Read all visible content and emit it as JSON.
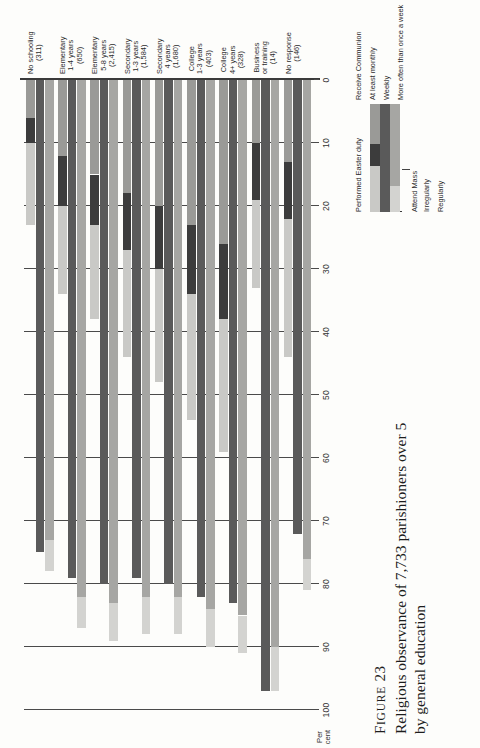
{
  "caption": {
    "figure_word": "F",
    "figure_word_rest": "IGURE",
    "figure_number": "23",
    "line1": "Religious observance of 7,733 parishioners over 5",
    "line2": "by general education"
  },
  "axis": {
    "title_line1": "Per",
    "title_line2": "cent",
    "ticks": [
      "100",
      "90",
      "80",
      "70",
      "60",
      "50",
      "40",
      "30",
      "20",
      "10",
      "0"
    ],
    "min": 0,
    "max": 100
  },
  "legend": {
    "group_a_label": "Attend Mass",
    "group_b_label": "Performed Easter duty",
    "group_c_label": "Receive Communion",
    "items": [
      {
        "label": "Irregularly",
        "color": "#d3d3d0"
      },
      {
        "label": "Regularly",
        "color": "#a6a6a3"
      },
      {
        "label": "At least monthly",
        "color": "#c9c9c6"
      },
      {
        "label": "Weekly",
        "color": "#3c3c3c"
      },
      {
        "label": "More often than once a week",
        "color": "#9a9a97"
      }
    ]
  },
  "colors": {
    "attend_irregularly": "#d3d3d0",
    "attend_regularly": "#a6a6a3",
    "easter_duty": "#5a5a5a",
    "comm_monthly": "#c9c9c6",
    "comm_weekly": "#3c3c3c",
    "comm_more_often": "#9a9a97",
    "gridline": "#4a4a4a",
    "baseline": "#3a3a3a"
  },
  "chart_data": {
    "type": "bar",
    "orientation": "horizontal",
    "stacked": true,
    "title": "Religious observance of 7,733 parishioners over 5 by general education",
    "xlabel": "Per cent",
    "ylabel": "",
    "xlim": [
      0,
      100
    ],
    "grid": true,
    "legend_position": "right",
    "categories": [
      "No schooling (311)",
      "Elementary 1-4 years (650)",
      "Elementary 5-8 years (2,415)",
      "Secondary 1-3 years (1,584)",
      "Secondary 4 years (1,680)",
      "College 1-3 years (403)",
      "College 4+ years (328)",
      "Business or training (14)",
      "No response (146)"
    ],
    "category_labels": [
      {
        "line1": "No schooling",
        "line2": "(311)",
        "line3": ""
      },
      {
        "line1": "Elementary",
        "line2": "1-4 years",
        "line3": "(650)"
      },
      {
        "line1": "Elementary",
        "line2": "5-8 years",
        "line3": "(2,415)"
      },
      {
        "line1": "Secondary",
        "line2": "1-3 years",
        "line3": "(1,584)"
      },
      {
        "line1": "Secondary",
        "line2": "4 years",
        "line3": "(1,680)"
      },
      {
        "line1": "College",
        "line2": "1-3 years",
        "line3": "(403)"
      },
      {
        "line1": "College",
        "line2": "4+ years",
        "line3": "(328)"
      },
      {
        "line1": "Business",
        "line2": "or training",
        "line3": "(14)"
      },
      {
        "line1": "No response",
        "line2": "(146)",
        "line3": ""
      }
    ],
    "series": [
      {
        "name": "Attend Mass - Regularly",
        "key": "attend_regularly",
        "values": [
          73,
          82,
          83,
          82,
          82,
          84,
          85,
          90,
          76
        ]
      },
      {
        "name": "Attend Mass - Irregularly",
        "key": "attend_irregularly",
        "values": [
          5,
          5,
          6,
          6,
          6,
          6,
          6,
          7,
          5
        ]
      },
      {
        "name": "Performed Easter duty",
        "key": "easter_duty",
        "values": [
          75,
          79,
          80,
          79,
          80,
          82,
          83,
          97,
          72
        ]
      },
      {
        "name": "Receive Communion - More often than once a week",
        "key": "comm_more_often",
        "values": [
          6,
          12,
          15,
          18,
          20,
          23,
          26,
          10,
          13
        ]
      },
      {
        "name": "Receive Communion - Weekly",
        "key": "comm_weekly",
        "values": [
          4,
          8,
          8,
          9,
          10,
          11,
          12,
          9,
          9
        ]
      },
      {
        "name": "Receive Communion - At least monthly",
        "key": "comm_monthly",
        "values": [
          13,
          14,
          15,
          17,
          18,
          20,
          21,
          14,
          22
        ]
      }
    ]
  }
}
